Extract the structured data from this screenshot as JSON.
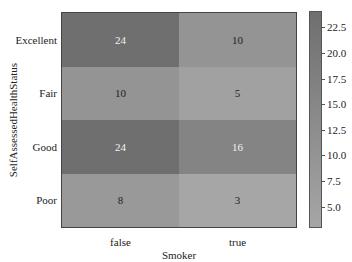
{
  "chart_data": {
    "type": "heatmap",
    "title": "",
    "xlabel": "Smoker",
    "ylabel": "SelfAssessedHealthStatus",
    "x_categories": [
      "false",
      "true"
    ],
    "y_categories": [
      "Excellent",
      "Fair",
      "Good",
      "Poor"
    ],
    "values": [
      [
        24,
        10
      ],
      [
        10,
        5
      ],
      [
        24,
        16
      ],
      [
        8,
        3
      ]
    ],
    "colorbar": {
      "ticks": [
        "5.0",
        "7.5",
        "10.0",
        "12.5",
        "15.0",
        "17.5",
        "20.0",
        "22.5"
      ],
      "range": [
        3,
        24
      ],
      "low_color": "#a6a6a6",
      "high_color": "#6f6f6f"
    },
    "annotations": true,
    "grid": false
  }
}
